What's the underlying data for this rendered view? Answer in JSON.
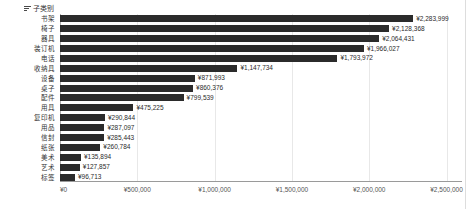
{
  "header": {
    "field_label": "子类别",
    "sort_icon": "sort-descending-icon"
  },
  "axis": {
    "ticks": [
      "¥0",
      "¥500,000",
      "¥1,000,000",
      "¥1,500,000",
      "¥2,000,000",
      "¥2,500,000"
    ]
  },
  "chart_data": {
    "type": "bar",
    "orientation": "horizontal",
    "title": "",
    "xlabel": "",
    "ylabel": "子类别",
    "xlim": [
      0,
      2600000
    ],
    "grid": true,
    "legend": false,
    "bar_color": "#2b2b2b",
    "categories": [
      "书架",
      "椅子",
      "器具",
      "装订机",
      "电话",
      "收纳具",
      "设备",
      "桌子",
      "配件",
      "用具",
      "复印机",
      "用品",
      "信封",
      "纸张",
      "美术",
      "艺术",
      "标签"
    ],
    "values": [
      2283999,
      2128368,
      2064431,
      1966027,
      1793972,
      1147734,
      871993,
      860376,
      799539,
      475225,
      290844,
      287097,
      285443,
      260784,
      135894,
      127857,
      96713
    ],
    "value_labels": [
      "¥2,283,999",
      "¥2,128,368",
      "¥2,064,431",
      "¥1,966,027",
      "¥1,793,972",
      "¥1,147,734",
      "¥871,993",
      "¥860,376",
      "¥799,539",
      "¥475,225",
      "¥290,844",
      "¥287,097",
      "¥285,443",
      "¥260,784",
      "¥135,894",
      "¥127,857",
      "¥96,713"
    ]
  }
}
